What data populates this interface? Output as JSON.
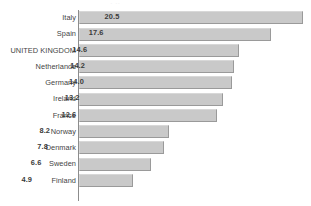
{
  "chart_data": {
    "type": "bar",
    "orientation": "horizontal",
    "title": "",
    "xlabel": "",
    "ylabel": "",
    "categories": [
      "Italy",
      "Spain",
      "UNITED KINGDOM",
      "Netherlands",
      "Germany",
      "Ireland",
      "France",
      "Norway",
      "Denmark",
      "Sweden",
      "Finland"
    ],
    "values": [
      20.5,
      17.6,
      14.6,
      14.2,
      14.0,
      13.2,
      12.6,
      8.2,
      7.8,
      6.6,
      4.9
    ],
    "value_labels": [
      "20.5",
      "17.6",
      "14.6",
      "14.2",
      "14.0",
      "13.2",
      "12.6",
      "8.2",
      "7.8",
      "6.6",
      "4.9"
    ],
    "xlim": [
      0,
      20.5
    ],
    "grid": false,
    "legend": false,
    "bar_color": "#c9c9c9",
    "bar_border_color": "#9a9a9a",
    "axis_color": "#8c8c8c",
    "label_color": "#444444",
    "value_color": "#3a3a3a",
    "highlighted_category": "UNITED KINGDOM"
  },
  "title_sliver": {
    "text": "·   ··"
  }
}
